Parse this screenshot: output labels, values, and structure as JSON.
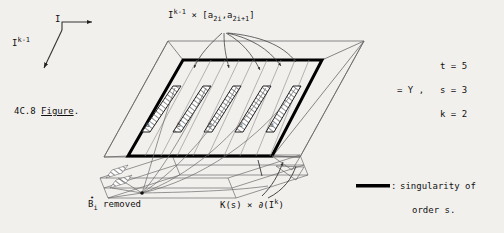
{
  "figure": {
    "caption_number": "4C.8",
    "caption_word": "Figure",
    "caption_period": ".",
    "background_color": "#f2f0ed",
    "ink_color": "#1a1a1a"
  },
  "axes": {
    "horizontal_label": "I",
    "diagonal_label_base": "I",
    "diagonal_label_exp": "k-1"
  },
  "top_label": {
    "base": "I",
    "exponent": "k-1",
    "times": " × [",
    "a_first_base": "a",
    "a_first_sub": "2i",
    "comma": ",",
    "a_second_base": "a",
    "a_second_sub": "2i+1",
    "close": "]",
    "full_text": "I^{k-1} × [a_2i , a_2i+1]"
  },
  "bottom_labels": {
    "b_removed": {
      "base": "B",
      "dot": "•",
      "sub": "i",
      "text": " removed",
      "full_text": "B°_i removed"
    },
    "boundary": {
      "k_of_s": "K(s)",
      "times": " × ",
      "partial": "∂(I",
      "exp": "k",
      "close": ")",
      "full_text": "K(s) × ∂(I^k)"
    }
  },
  "right_annotations": {
    "equals_y": "= Y ,",
    "t": "t = 5",
    "s": "s = 3",
    "k": "k = 2"
  },
  "legend": {
    "colon": ":",
    "line_1": "singularity of",
    "line_2": "order s.",
    "swatch_color": "#000000",
    "full_text": ": singularity of order s."
  },
  "diagram": {
    "strip_count": 5,
    "strip_labels": [
      "B",
      "B",
      "B",
      "B",
      "B"
    ],
    "bold_outline_color": "#000000",
    "thin_line_color": "#555555",
    "hatch_color": "#333333",
    "layer_count": 3
  }
}
